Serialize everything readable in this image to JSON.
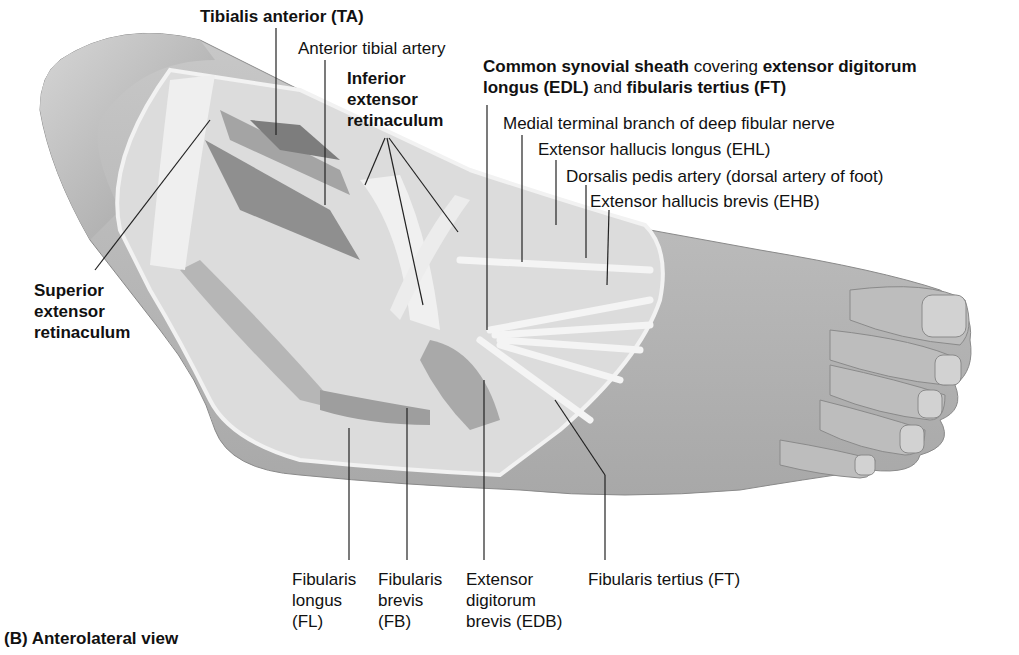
{
  "figure": {
    "caption": "(B) Anterolateral view",
    "colors": {
      "skin": "#b9b9b9",
      "skin_dark": "#9a9a9a",
      "tendon": "#e8e8e8",
      "muscle": "#8e8e8e",
      "leader_line": "#222222",
      "text": "#111111"
    }
  },
  "labels": {
    "tibialis_anterior": "Tibialis anterior (TA)",
    "anterior_tibial_artery": "Anterior tibial artery",
    "inferior_extensor_retinaculum": [
      "Inferior",
      "extensor",
      "retinaculum"
    ],
    "common_synovial_sheath": {
      "line1_bold": "Common synovial sheath",
      "line1_normal": " covering ",
      "line1_bold2": "extensor digitorum",
      "line2_bold": "longus (EDL)",
      "line2_normal": " and ",
      "line2_bold2": "fibularis tertius (FT)"
    },
    "medial_terminal_branch": "Medial terminal branch of deep fibular nerve",
    "extensor_hallucis_longus": "Extensor hallucis longus (EHL)",
    "dorsalis_pedis_artery": "Dorsalis pedis artery (dorsal artery of foot)",
    "extensor_hallucis_brevis": "Extensor hallucis brevis (EHB)",
    "superior_extensor_retinaculum": [
      "Superior",
      "extensor",
      "retinaculum"
    ],
    "fibularis_longus": [
      "Fibularis",
      "longus",
      "(FL)"
    ],
    "fibularis_brevis": [
      "Fibularis",
      "brevis",
      "(FB)"
    ],
    "extensor_digitorum_brevis": [
      "Extensor",
      "digitorum",
      "brevis (EDB)"
    ],
    "fibularis_tertius": "Fibularis tertius (FT)"
  }
}
